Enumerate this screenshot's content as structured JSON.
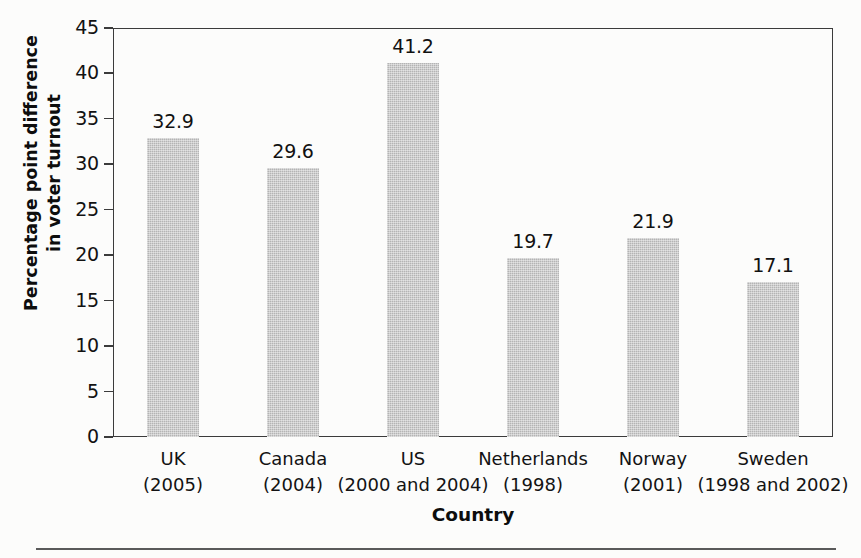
{
  "chart_data": {
    "type": "bar",
    "title": "",
    "xlabel": "Country",
    "ylabel": "Percentage point difference in voter turnout",
    "ylabel_line1": "Percentage point difference",
    "ylabel_line2": "in voter turnout",
    "ylim": [
      0,
      45
    ],
    "yticks": [
      "0",
      "5",
      "10",
      "15",
      "20",
      "25",
      "30",
      "35",
      "40",
      "45"
    ],
    "ytick_values": [
      0,
      5,
      10,
      15,
      20,
      25,
      30,
      35,
      40,
      45
    ],
    "grid": false,
    "legend": "none",
    "categories": [
      "UK (2005)",
      "Canada (2004)",
      "US (2000 and 2004)",
      "Netherlands (1998)",
      "Norway (2001)",
      "Sweden (1998 and 2002)"
    ],
    "category_parts": [
      {
        "name": "UK",
        "year": "(2005)"
      },
      {
        "name": "Canada",
        "year": "(2004)"
      },
      {
        "name": "US",
        "year": "(2000 and 2004)"
      },
      {
        "name": "Netherlands",
        "year": "(1998)"
      },
      {
        "name": "Norway",
        "year": "(2001)"
      },
      {
        "name": "Sweden",
        "year": "(1998 and 2002)"
      }
    ],
    "values": [
      32.9,
      29.6,
      41.2,
      19.7,
      21.9,
      17.1
    ],
    "value_labels": [
      "32.9",
      "29.6",
      "41.2",
      "19.7",
      "21.9",
      "17.1"
    ],
    "bar_color": "#b4b4b4",
    "axis_color": "#3b3b3b",
    "text_color": "#111111",
    "background": "#fcfcfb"
  }
}
